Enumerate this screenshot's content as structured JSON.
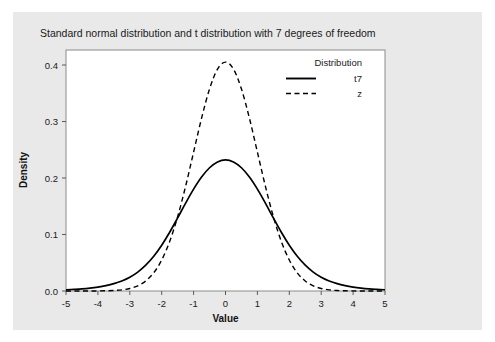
{
  "figure": {
    "background_color": "#e9e9e9",
    "panel_color": "#ffffff",
    "border_color": "#8c8c8c"
  },
  "chart_data": {
    "type": "line",
    "title": "Standard normal distribution and t distribution with 7 degrees of freedom",
    "xlabel": "Value",
    "ylabel": "Density",
    "xlim": [
      -5,
      5
    ],
    "ylim": [
      0.0,
      0.42
    ],
    "xticks": [
      -5,
      -4,
      -3,
      -2,
      -1,
      0,
      1,
      2,
      3,
      4,
      5
    ],
    "xticklabels": [
      "-5",
      "-4",
      "-3",
      "-2",
      "-1",
      "0",
      "1",
      "2",
      "3",
      "4",
      "5"
    ],
    "yticks": [
      0.0,
      0.1,
      0.2,
      0.3,
      0.4
    ],
    "yticklabels": [
      "0.0",
      "0.1",
      "0.2",
      "0.3",
      "0.4"
    ],
    "grid": false,
    "legend": {
      "title": "Distribution",
      "position": "top-right",
      "entries": [
        {
          "label": "t7",
          "style": "solid",
          "color": "#000000"
        },
        {
          "label": "z",
          "style": "dashed",
          "color": "#000000"
        }
      ]
    },
    "x": [
      -5.0,
      -4.75,
      -4.5,
      -4.25,
      -4.0,
      -3.75,
      -3.5,
      -3.25,
      -3.0,
      -2.75,
      -2.5,
      -2.25,
      -2.0,
      -1.75,
      -1.5,
      -1.25,
      -1.0,
      -0.75,
      -0.5,
      -0.25,
      0.0,
      0.25,
      0.5,
      0.75,
      1.0,
      1.25,
      1.5,
      1.75,
      2.0,
      2.25,
      2.5,
      2.75,
      3.0,
      3.25,
      3.5,
      3.75,
      4.0,
      4.25,
      4.5,
      4.75,
      5.0
    ],
    "series": [
      {
        "name": "t7",
        "style": "solid",
        "color": "#000000",
        "values": [
          0.0022,
          0.0029,
          0.0038,
          0.0051,
          0.0069,
          0.0094,
          0.0128,
          0.0175,
          0.024,
          0.033,
          0.045,
          0.0605,
          0.0798,
          0.1024,
          0.1274,
          0.1531,
          0.1775,
          0.1986,
          0.2148,
          0.2249,
          0.2284,
          0.2249,
          0.2148,
          0.1986,
          0.1775,
          0.1531,
          0.1274,
          0.1024,
          0.0798,
          0.0605,
          0.045,
          0.033,
          0.024,
          0.0175,
          0.0128,
          0.0094,
          0.0069,
          0.0051,
          0.0038,
          0.0029,
          0.0022
        ]
      },
      {
        "name": "z",
        "style": "dashed",
        "color": "#000000",
        "values": [
          1.5e-06,
          5.3e-06,
          1.6e-05,
          4.57e-05,
          0.0001338,
          0.0003734,
          0.0008727,
          0.00203,
          0.0044318,
          0.0090937,
          0.0175283,
          0.0316579,
          0.053991,
          0.0862773,
          0.1295176,
          0.1826491,
          0.2419707,
          0.3011374,
          0.3520653,
          0.3866681,
          0.3989423,
          0.3866681,
          0.3520653,
          0.3011374,
          0.2419707,
          0.1826491,
          0.1295176,
          0.0862773,
          0.053991,
          0.0316579,
          0.0175283,
          0.0090937,
          0.0044318,
          0.00203,
          0.0008727,
          0.0003734,
          0.0001338,
          4.57e-05,
          1.6e-05,
          5.3e-06,
          1.5e-06
        ]
      }
    ],
    "peak_values": {
      "t7": 0.2284,
      "z": 0.3989
    }
  }
}
